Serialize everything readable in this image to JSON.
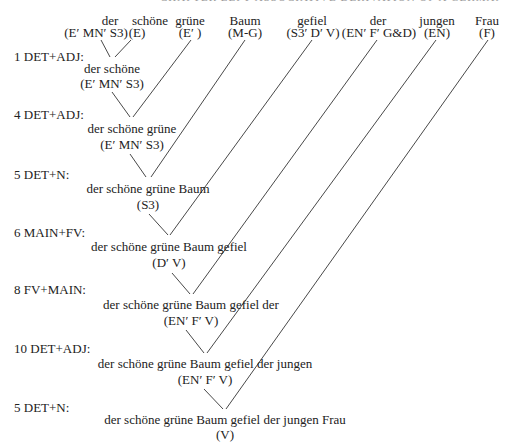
{
  "header": {
    "text": "CHAPTER LEFT-ASSOCIATIVE DERIVATION OF A GERMAN PHRASE"
  },
  "words": [
    {
      "word": "der",
      "tag": "(E′ MN′ S3)"
    },
    {
      "word": "schöne",
      "tag": "(E)"
    },
    {
      "word": "grüne",
      "tag": "(E′ )"
    },
    {
      "word": "Baum",
      "tag": "(M-G)"
    },
    {
      "word": "gefiel",
      "tag": "(S3′ D′ V)"
    },
    {
      "word": "der",
      "tag": "(EN′ F′ G&D)"
    },
    {
      "word": "jungen",
      "tag": "(EN)"
    },
    {
      "word": "Frau",
      "tag": "(F)"
    }
  ],
  "steps": [
    {
      "label": "1 DET+ADJ:",
      "phrase": "der schöne",
      "tag": "(E′ MN′ S3)"
    },
    {
      "label": "4 DET+ADJ:",
      "phrase": "der schöne grüne",
      "tag": "(E′ MN′ S3)"
    },
    {
      "label": "5 DET+N:",
      "phrase": "der schöne grüne Baum",
      "tag": "(S3)"
    },
    {
      "label": "6 MAIN+FV:",
      "phrase": "der schöne grüne Baum gefiel",
      "tag": "(D′ V)"
    },
    {
      "label": "8 FV+MAIN:",
      "phrase": "der schöne grüne Baum gefiel der",
      "tag": "(EN′ F′ V)"
    },
    {
      "label": "10 DET+ADJ:",
      "phrase": "der schöne grüne Baum gefiel der jungen",
      "tag": "(EN′ F′ V)"
    },
    {
      "label": "5 DET+N:",
      "phrase": "der schöne grüne Baum gefiel der jungen Frau",
      "tag": "(V)"
    }
  ]
}
